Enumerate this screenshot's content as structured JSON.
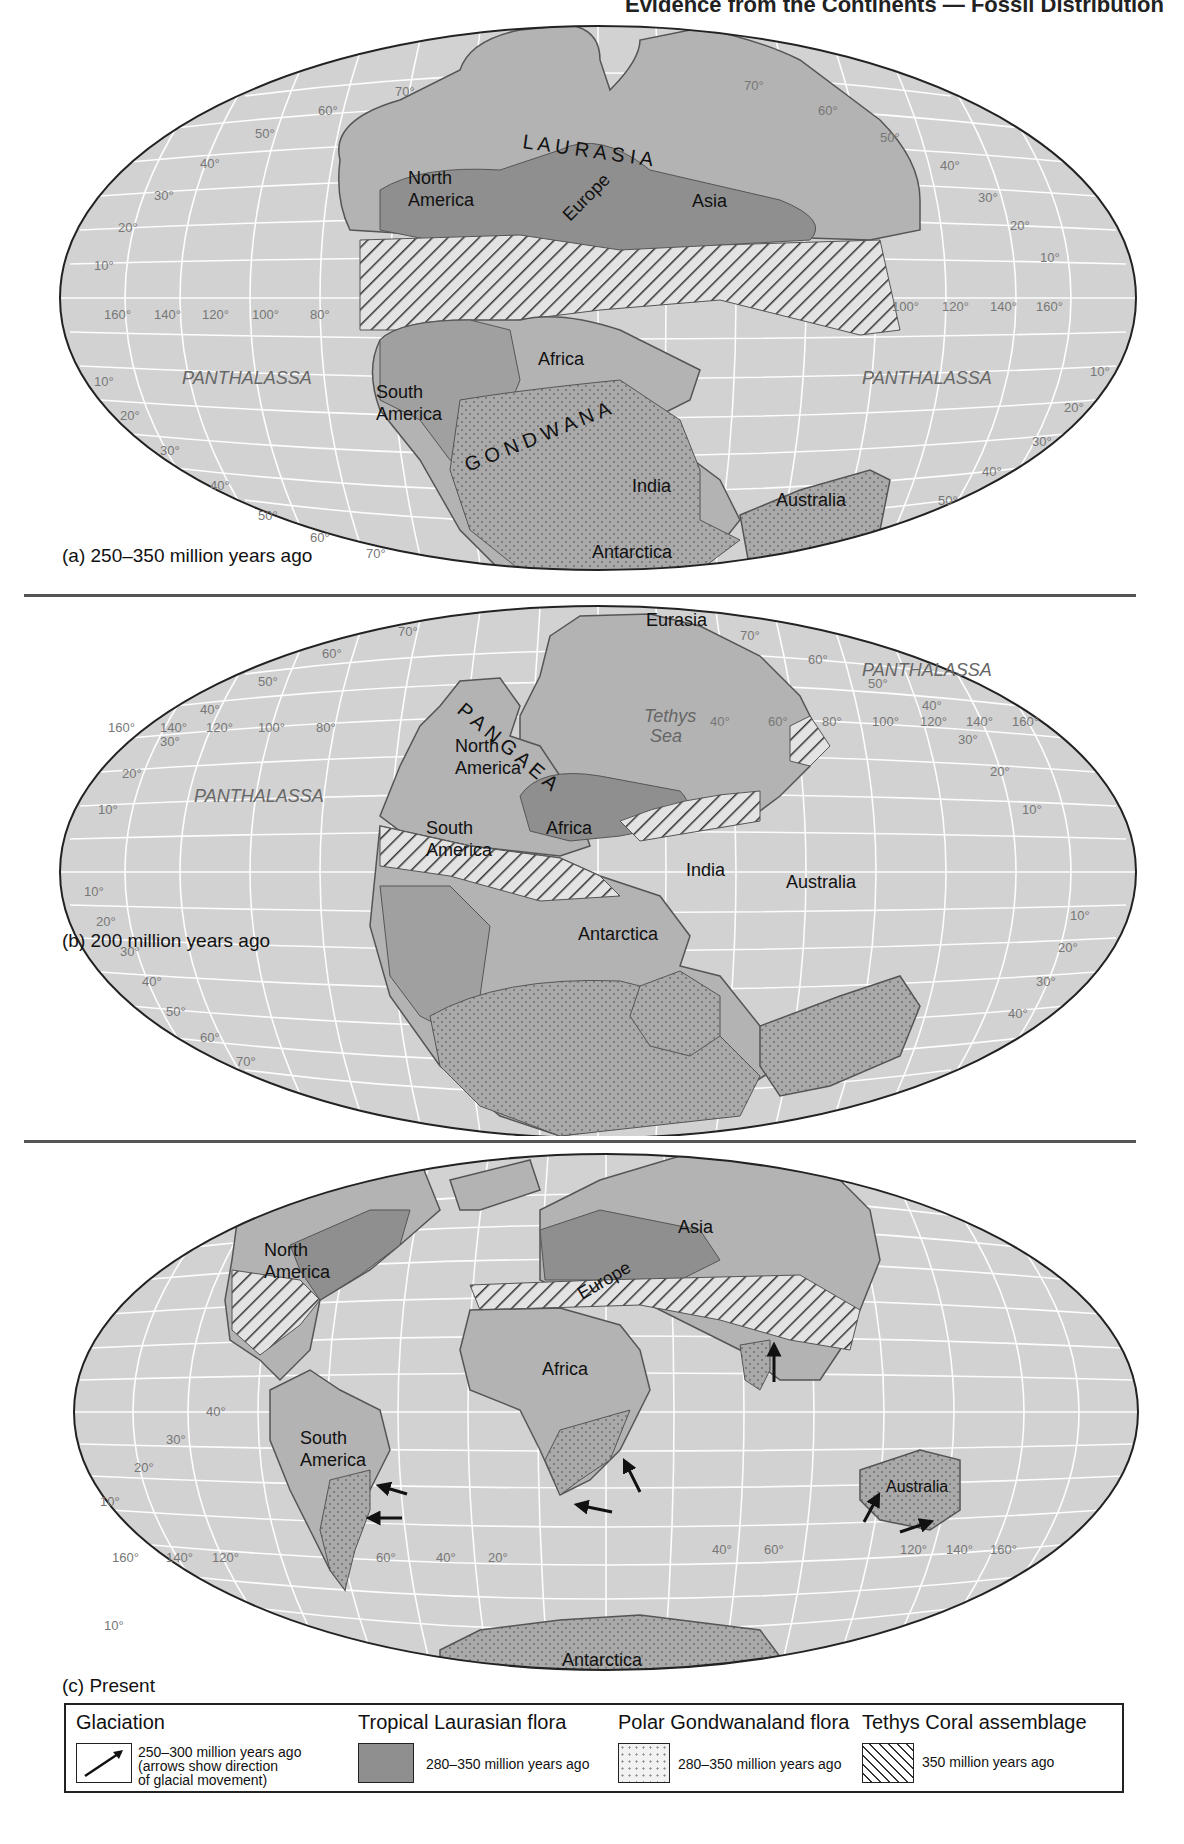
{
  "header": {
    "title": "Evidence from the Continents — Fossil Distribution"
  },
  "colors": {
    "ocean": "#d2d2d2",
    "grid": "#ffffff",
    "continent": "#b3b3b3",
    "laurasian_flora": "#8f8f8f",
    "gondwana_flora": "#a9a9a9",
    "outline": "#555555",
    "label_gray": "#666666"
  },
  "panels": [
    {
      "id": "a",
      "caption": "(a) 250–350 million years ago",
      "supercontinents": [
        "L A U R A S I A",
        "G O N D W A N A"
      ],
      "oceans": [
        "PANTHALASSA",
        "PANTHALASSA"
      ],
      "continents": [
        "North America",
        "Europe",
        "Asia",
        "Africa",
        "South America",
        "India",
        "Australia",
        "Antarctica"
      ],
      "lat_labels": [
        "70°",
        "60°",
        "50°",
        "40°",
        "30°",
        "20°",
        "10°",
        "10°",
        "20°",
        "30°",
        "40°",
        "50°",
        "60°",
        "70°"
      ],
      "lon_labels_left": [
        "160°",
        "140°",
        "120°",
        "100°",
        "80°"
      ],
      "lon_labels_right": [
        "100°",
        "120°",
        "140°",
        "160°"
      ]
    },
    {
      "id": "b",
      "caption": "(b) 200 million years ago",
      "supercontinents": [
        "P A N G A E A"
      ],
      "oceans": [
        "PANTHALASSA",
        "PANTHALASSA",
        "Tethys",
        "Sea"
      ],
      "continents": [
        "North America",
        "Eurasia",
        "South America",
        "Africa",
        "India",
        "Australia",
        "Antarctica"
      ],
      "lat_labels": [
        "70°",
        "60°",
        "50°",
        "40°",
        "30°",
        "20°",
        "10°",
        "10°",
        "20°",
        "30°",
        "40°",
        "50°",
        "60°",
        "70°"
      ],
      "lon_labels_left": [
        "160°",
        "140°",
        "120°",
        "100°",
        "80°"
      ],
      "lon_labels_right": [
        "40°",
        "60°",
        "80°",
        "100°",
        "120°",
        "140°",
        "160°"
      ]
    },
    {
      "id": "c",
      "caption": "(c) Present",
      "continents": [
        "North America",
        "Europe",
        "Asia",
        "Africa",
        "South America",
        "Australia",
        "Antarctica"
      ],
      "lat_labels": [
        "40°",
        "30°",
        "20°",
        "10°",
        "10°",
        "20°",
        "30°",
        "40°",
        "50°",
        "60°",
        "70°",
        "50°",
        "40°",
        "30°",
        "20°",
        "10°",
        "10°",
        "20°",
        "30°",
        "40°",
        "50°",
        "60°"
      ],
      "lon_labels_left": [
        "160°",
        "140°",
        "120°",
        "60°",
        "40°",
        "20°"
      ],
      "lon_labels_right": [
        "40°",
        "60°",
        "120°",
        "140°",
        "160°"
      ]
    }
  ],
  "legend": {
    "glaciation": {
      "title": "Glaciation",
      "line1": "250–300 million years ago",
      "line2": "(arrows show direction",
      "line3": "of glacial movement)",
      "icon": "arrow-icon"
    },
    "tropical": {
      "title": "Tropical Laurasian flora",
      "text": "280–350 million years ago",
      "pattern": "solid-dark-gray"
    },
    "polar": {
      "title": "Polar Gondwanaland flora",
      "text": "280–350 million years ago",
      "pattern": "stippled"
    },
    "coral": {
      "title": "Tethys Coral assemblage",
      "text": "350 million years ago",
      "pattern": "diagonal-hatch"
    }
  }
}
